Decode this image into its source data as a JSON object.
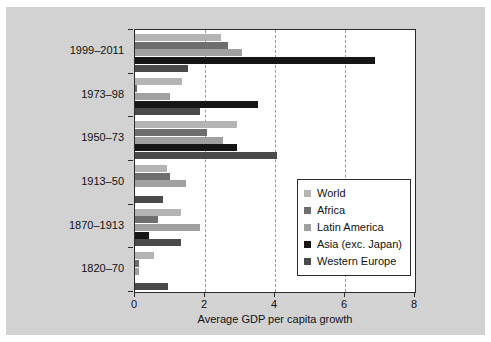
{
  "chart_data": {
    "type": "bar",
    "orientation": "horizontal",
    "title": "",
    "xlabel": "Average GDP per capita growth",
    "ylabel": "",
    "xlim": [
      0,
      8
    ],
    "xticks": [
      0,
      2,
      4,
      6,
      8
    ],
    "xticklabels": [
      "0",
      "2",
      "4",
      "6",
      "8"
    ],
    "grid": "vertical-dashed",
    "legend_position": "center-right",
    "categories": [
      "1820–70",
      "1870–1913",
      "1913–50",
      "1950–73",
      "1973–98",
      "1999–2011"
    ],
    "categories_top_to_bottom": [
      "1999–2011",
      "1973–98",
      "1950–73",
      "1913–50",
      "1870–1913",
      "1820–70"
    ],
    "series": [
      {
        "name": "World",
        "color": "#b4b4b4",
        "values_top_to_bottom": [
          2.45,
          1.35,
          2.9,
          0.9,
          1.3,
          0.55
        ]
      },
      {
        "name": "Africa",
        "color": "#6e6e6e",
        "values_top_to_bottom": [
          2.65,
          0.05,
          2.05,
          1.0,
          0.65,
          0.1
        ]
      },
      {
        "name": "Latin America",
        "color": "#a0a0a0",
        "values_top_to_bottom": [
          3.05,
          1.0,
          2.5,
          1.45,
          1.85,
          0.1
        ]
      },
      {
        "name": "Asia (exc. Japan)",
        "color": "#161616",
        "values_top_to_bottom": [
          6.85,
          3.5,
          2.9,
          0.0,
          0.4,
          0.0
        ]
      },
      {
        "name": "Western Europe",
        "color": "#4a4a4a",
        "values_top_to_bottom": [
          1.5,
          1.85,
          4.05,
          0.8,
          1.3,
          0.95
        ]
      }
    ]
  },
  "legend": {
    "items": [
      {
        "label": "World",
        "color": "#b4b4b4"
      },
      {
        "label": "Africa",
        "color": "#6e6e6e"
      },
      {
        "label": "Latin America",
        "color": "#a0a0a0"
      },
      {
        "label": "Asia (exc. Japan)",
        "color": "#161616"
      },
      {
        "label": "Western Europe",
        "color": "#4a4a4a"
      }
    ]
  },
  "figure": {
    "background": "#d2d2d2",
    "plot_background": "#ffffff",
    "axis_color": "#2b2b2b",
    "gridline_color": "#9a9a9a"
  }
}
